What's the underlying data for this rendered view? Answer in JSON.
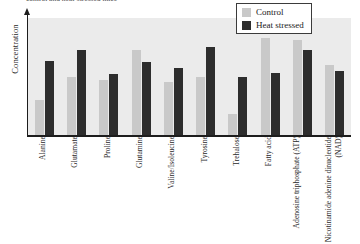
{
  "caption": {
    "text": "control and heat-stressed mice"
  },
  "axes": {
    "ylabel": "Concentration",
    "xlabel": ""
  },
  "legend": {
    "title": "",
    "items": [
      {
        "label": "Control",
        "color": "#c9c9c9",
        "swatch_name": "legend-swatch-control"
      },
      {
        "label": "Heat stressed",
        "color": "#2d2d2d",
        "swatch_name": "legend-swatch-heat-stressed"
      }
    ]
  },
  "colors": {
    "control": "#c9c9c9",
    "heat_stressed": "#2d2d2d",
    "plot_background": "#ebebeb",
    "axis": "#1d1d1d",
    "page_background": "#ffffff"
  },
  "chart_data": {
    "type": "bar",
    "title": "",
    "subtitle": "",
    "xlabel": "",
    "ylabel": "Concentration",
    "ylim": [
      0,
      100
    ],
    "grid": false,
    "legend_position": "top-right",
    "axis_tick_labels_y": [],
    "categories": [
      "Alanine",
      "Glutamate",
      "Proline",
      "Glutamine",
      "Valine/Isoleucine",
      "Tyrosine",
      "Trehalose",
      "Fatty acid",
      "Adenosine triphosphate (ATP)",
      "Nicotinamide adenine dinucleotide (NAD)"
    ],
    "series": [
      {
        "name": "Control",
        "color": "#c9c9c9",
        "values": [
          30,
          50,
          47,
          73,
          45,
          50,
          18,
          83,
          81,
          60
        ]
      },
      {
        "name": "Heat stressed",
        "color": "#2d2d2d",
        "values": [
          63,
          73,
          52,
          62,
          57,
          75,
          50,
          53,
          73,
          55
        ]
      }
    ]
  }
}
